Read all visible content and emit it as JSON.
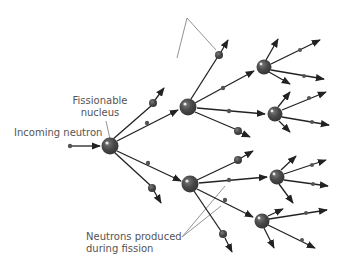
{
  "diagram": {
    "labels": {
      "incoming_neutron": "Incoming neutron",
      "fissionable_nucleus_line1": "Fissionable",
      "fissionable_nucleus_line2": "nucleus",
      "neutrons_produced_line1": "Neutrons produced",
      "neutrons_produced_line2": "during fission"
    },
    "colors": {
      "nucleus": "#4a4a4a",
      "nucleus_highlight": "#e8e8e8",
      "arrow": "#222222",
      "leader_line": "#777777",
      "label_text": "#555555",
      "background": "#ffffff"
    },
    "nuclei": [
      {
        "id": "A",
        "x": 110,
        "y": 146,
        "r": 8.5
      },
      {
        "id": "B",
        "x": 188,
        "y": 107,
        "r": 8.5
      },
      {
        "id": "E",
        "x": 190,
        "y": 184,
        "r": 8.5
      },
      {
        "id": "C",
        "x": 264,
        "y": 67,
        "r": 7.5
      },
      {
        "id": "D",
        "x": 275,
        "y": 114,
        "r": 7.5
      },
      {
        "id": "F",
        "x": 277,
        "y": 177,
        "r": 7.5
      },
      {
        "id": "G",
        "x": 262,
        "y": 221,
        "r": 7.5
      }
    ],
    "small_nuclei": [
      {
        "x": 153,
        "y": 103,
        "r": 4
      },
      {
        "x": 152,
        "y": 188,
        "r": 4
      },
      {
        "x": 219,
        "y": 55,
        "r": 4
      },
      {
        "x": 238,
        "y": 131,
        "r": 4
      },
      {
        "x": 238,
        "y": 160,
        "r": 4
      },
      {
        "x": 223,
        "y": 234,
        "r": 4
      }
    ]
  }
}
